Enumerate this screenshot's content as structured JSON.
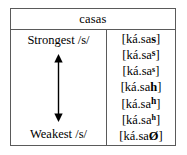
{
  "table": {
    "header": {
      "title": "casas"
    },
    "scale": {
      "top_label": "Strongest /s/",
      "bottom_label": "Weakest /s/",
      "arrow_icon": "double-headed-vertical-arrow-icon"
    },
    "rows": [
      {
        "prefix": "[ká.sa",
        "coda": "s",
        "suffix": "]",
        "coda_style": "normal"
      },
      {
        "prefix": "[ká.sa",
        "coda": "s",
        "suffix": "]",
        "coda_style": "superscript-large"
      },
      {
        "prefix": "[ká.sa",
        "coda": "s",
        "suffix": "]",
        "coda_style": "superscript-small"
      },
      {
        "prefix": "[ká.sa",
        "coda": "h",
        "suffix": "]",
        "coda_style": "normal"
      },
      {
        "prefix": "[ká.sa",
        "coda": "h",
        "suffix": "]",
        "coda_style": "superscript-large"
      },
      {
        "prefix": "[ká.sa",
        "coda": "h",
        "suffix": "]",
        "coda_style": "superscript-small"
      },
      {
        "prefix": "[ká.sa",
        "coda": "Ø",
        "suffix": "]",
        "coda_style": "normal"
      }
    ]
  },
  "colors": {
    "border": "#5a5a5a",
    "text": "#000000",
    "background": "#ffffff"
  }
}
